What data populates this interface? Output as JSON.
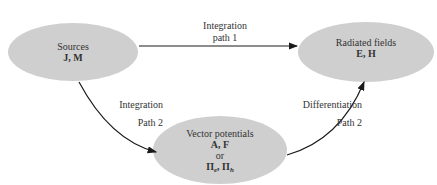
{
  "nodes": {
    "sources": {
      "title": "Sources",
      "symbols": "J, M"
    },
    "radiated": {
      "title": "Radiated fields",
      "symbols": "E, H"
    },
    "potentials": {
      "title": "Vector potentials",
      "symbols": "A, F",
      "or": "or",
      "pi_e": "Π",
      "pi_e_sub": "e",
      "sep": ", ",
      "pi_h": "Π",
      "pi_h_sub": "h"
    }
  },
  "edges": {
    "path1": {
      "line1": "Integration",
      "line2": "path 1"
    },
    "integration2": {
      "line1": "Integration",
      "line2": "Path 2"
    },
    "differentiation2": {
      "line1": "Differentiation",
      "line2": "Path 2"
    }
  },
  "colors": {
    "node_fill": "#cfcfcf",
    "line": "#1a1a1a"
  }
}
